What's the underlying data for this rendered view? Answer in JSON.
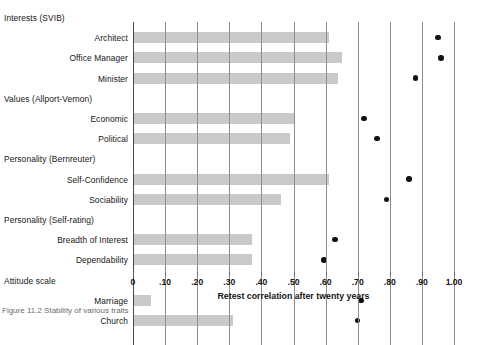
{
  "chart_data": {
    "type": "bar",
    "title": "",
    "xlabel": "Retest correlation after twenty years",
    "ylabel": "",
    "xlim": [
      0,
      1.0
    ],
    "grid": true,
    "legend_position": "none",
    "tick_labels": [
      "0",
      ".10",
      ".20",
      ".30",
      ".40",
      ".50",
      ".60",
      ".70",
      ".80",
      ".90",
      "1.00"
    ],
    "tick_values": [
      0,
      0.1,
      0.2,
      0.3,
      0.4,
      0.5,
      0.6,
      0.7,
      0.8,
      0.9,
      1.0
    ],
    "groups": [
      {
        "name": "Interests (SVIB)",
        "items": [
          {
            "label": "Architect",
            "bar": 0.61,
            "dot": 0.95
          },
          {
            "label": "Office Manager",
            "bar": 0.65,
            "dot": 0.96
          },
          {
            "label": "Minister",
            "bar": 0.64,
            "dot": 0.88
          }
        ]
      },
      {
        "name": "Values (Allport-Vernon)",
        "items": [
          {
            "label": "Economic",
            "bar": 0.5,
            "dot": 0.72
          },
          {
            "label": "Political",
            "bar": 0.49,
            "dot": 0.76
          }
        ]
      },
      {
        "name": "Personality (Bernreuter)",
        "items": [
          {
            "label": "Self-Confidence",
            "bar": 0.61,
            "dot": 0.86
          },
          {
            "label": "Sociability",
            "bar": 0.46,
            "dot": 0.79
          }
        ]
      },
      {
        "name": "Personality (Self-rating)",
        "items": [
          {
            "label": "Breadth of Interest",
            "bar": 0.37,
            "dot": 0.63
          },
          {
            "label": "Dependability",
            "bar": 0.37,
            "dot": 0.595
          }
        ]
      },
      {
        "name": "Attitude scale",
        "items": [
          {
            "label": "Marriage",
            "bar": 0.055,
            "dot": 0.71
          },
          {
            "label": "Church",
            "bar": 0.31,
            "dot": 0.7
          }
        ]
      }
    ]
  },
  "colors": {
    "bar": "#c9c9c9",
    "dot": "#111111",
    "gridline": "#8d8d8d",
    "text": "#151515"
  },
  "caption": "Figure 11.2   Stability of various traits"
}
